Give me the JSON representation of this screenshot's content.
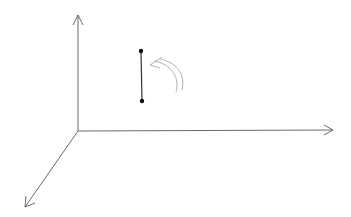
{
  "diagram": {
    "title": "",
    "background": "#ffffff",
    "axis_color": "#6a6a6a",
    "segment_color": "#222222",
    "rotation_arrow_color": "#b0b0b0",
    "axes": [
      {
        "name": "y-axis",
        "direction": "up",
        "label": ""
      },
      {
        "name": "x-axis",
        "direction": "right",
        "label": ""
      },
      {
        "name": "z-axis",
        "direction": "down-left",
        "label": ""
      }
    ],
    "segment": {
      "description": "vertical line segment with endpoints",
      "endpoints": 2
    },
    "rotation_arrow": {
      "description": "curved arrow indicating counter-clockwise rotation"
    }
  }
}
